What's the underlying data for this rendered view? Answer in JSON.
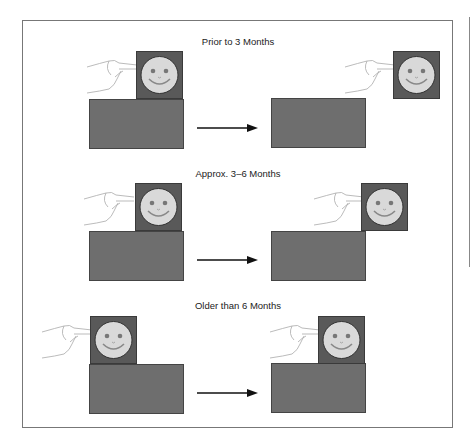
{
  "panels": [
    {
      "title": "Prior to 3 Months",
      "left": {
        "square": [
          136,
          51
        ],
        "rect": [
          89,
          99
        ],
        "hand": [
          85,
          55
        ]
      },
      "right": {
        "square": [
          393,
          51
        ],
        "rect": [
          271,
          98
        ],
        "hand": [
          343,
          55
        ]
      }
    },
    {
      "title": "Approx. 3–6 Months",
      "left": {
        "square": [
          135,
          183
        ],
        "rect": [
          89,
          231
        ],
        "hand": [
          82,
          187
        ]
      },
      "right": {
        "square": [
          361,
          183
        ],
        "rect": [
          271,
          231
        ],
        "hand": [
          312,
          187
        ]
      }
    },
    {
      "title": "Older than 6 Months",
      "left": {
        "square": [
          90,
          316
        ],
        "rect": [
          89,
          364
        ],
        "hand": [
          40,
          320
        ]
      },
      "right": {
        "square": [
          318,
          316
        ],
        "rect": [
          271,
          363
        ],
        "hand": [
          268,
          320
        ]
      }
    }
  ],
  "titles": [
    "Prior to 3 Months",
    "Approx. 3–6 Months",
    "Older than 6 Months"
  ],
  "colors": {
    "square": "#595959",
    "rect": "#6e6e6e",
    "face": "#d9d9d9",
    "frame": "#777777"
  }
}
